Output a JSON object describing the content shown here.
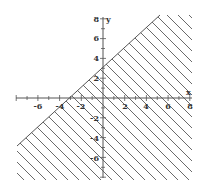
{
  "chart_data": {
    "type": "inequality-region",
    "title": "",
    "xlabel": "x",
    "ylabel": "y",
    "xlim": [
      -8,
      8
    ],
    "ylim": [
      -8,
      8
    ],
    "grid": false,
    "x_ticks": [
      -6,
      -4,
      -2,
      2,
      4,
      6,
      8
    ],
    "y_ticks": [
      8,
      6,
      4,
      2,
      -2,
      -4,
      -6
    ],
    "boundary_line": {
      "slope": 1,
      "intercept": 3,
      "equation": "y = x + 3",
      "style": "solid"
    },
    "shaded_region": "below",
    "inequality": "y <= x + 3",
    "hatch": "diagonal lines"
  },
  "colors": {
    "axis": "#555555",
    "hatch": "#444444",
    "text": "#333333",
    "background": "#ffffff"
  },
  "labels": {
    "x_axis": "x",
    "y_axis": "y",
    "xt": [
      "-6",
      "-4",
      "-2",
      "2",
      "4",
      "6",
      "8"
    ],
    "yt": [
      "8",
      "6",
      "4",
      "2",
      "-2",
      "-4",
      "-6"
    ]
  }
}
